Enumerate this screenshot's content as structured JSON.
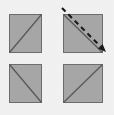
{
  "figure": {
    "kind": "geometric-diagram",
    "description": "Square divided into four shaded sub-squares separated by a white cross, each sub-square crossed by a diagonal, with a dashed arrow along the upper-right diagonal",
    "canvas": {
      "width": 114,
      "height": 115
    },
    "colors": {
      "background": "#f3f3f3",
      "square_fill": "#a8a8a8",
      "square_stroke": "#6e6e6e",
      "diagonal_stroke": "#5a5a5a",
      "cross_fill": "#ffffff",
      "arrow_stroke": "#1a1a1a"
    },
    "outer_square": {
      "label": "",
      "x": 9,
      "y": 14,
      "width": 94,
      "height": 89
    },
    "cross": {
      "label": "",
      "vertical_band": {
        "x": 42,
        "y": 14,
        "width": 21,
        "height": 89
      },
      "horizontal_band": {
        "x": 9,
        "y": 53,
        "width": 94,
        "height": 11
      }
    },
    "quadrants": [
      {
        "name": "top-left",
        "label": "",
        "x": 9,
        "y": 14,
        "width": 33,
        "height": 39,
        "diagonal": {
          "direction": "anti",
          "from": "top-right",
          "to": "bottom-left"
        }
      },
      {
        "name": "top-right",
        "label": "",
        "x": 63,
        "y": 14,
        "width": 40,
        "height": 39,
        "diagonal": {
          "direction": "main",
          "from": "top-left",
          "to": "bottom-right"
        }
      },
      {
        "name": "bottom-left",
        "label": "",
        "x": 9,
        "y": 64,
        "width": 33,
        "height": 39,
        "diagonal": {
          "direction": "main",
          "from": "top-left",
          "to": "bottom-right"
        }
      },
      {
        "name": "bottom-right",
        "label": "",
        "x": 63,
        "y": 64,
        "width": 40,
        "height": 39,
        "diagonal": {
          "direction": "anti",
          "from": "bottom-left",
          "to": "top-right"
        }
      }
    ],
    "arrow": {
      "label": "",
      "style": "dashed",
      "x1": 62,
      "y1": 8,
      "x2": 106,
      "y2": 52,
      "head": "end"
    }
  }
}
